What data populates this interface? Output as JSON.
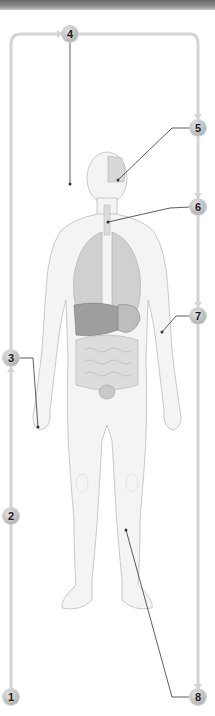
{
  "diagram": {
    "type": "anatomical-flow-diagram",
    "flow_color": "#d4d4d4",
    "leader_color": "#333333",
    "badges": [
      {
        "id": "1",
        "label": "1",
        "x": 11,
        "y": 697
      },
      {
        "id": "2",
        "label": "2",
        "x": 11,
        "y": 516
      },
      {
        "id": "3",
        "label": "3",
        "x": 11,
        "y": 358
      },
      {
        "id": "4",
        "label": "4",
        "x": 70,
        "y": 34
      },
      {
        "id": "5",
        "label": "5",
        "x": 198,
        "y": 128
      },
      {
        "id": "6",
        "label": "6",
        "x": 198,
        "y": 207
      },
      {
        "id": "7",
        "label": "7",
        "x": 198,
        "y": 316
      },
      {
        "id": "8",
        "label": "8",
        "x": 198,
        "y": 697
      }
    ]
  }
}
